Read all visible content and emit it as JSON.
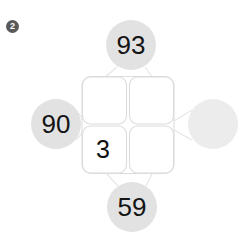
{
  "marker": {
    "label": "2",
    "name": "problem-number-badge"
  },
  "colors": {
    "bubble_fill": "#e2e2e2",
    "bubble_fill_empty": "#ececec",
    "connector_stroke": "#e6e6e6",
    "grid_stroke": "#dcdcdc",
    "cell_fill": "#ffffff",
    "text": "#101010",
    "marker_fill": "#5a5a5a",
    "marker_text": "#ffffff",
    "background": "#ffffff"
  },
  "diagram": {
    "type": "number-bond-box",
    "bubbles": {
      "top": {
        "value": "93",
        "empty": false
      },
      "left": {
        "value": "90",
        "empty": false
      },
      "right": {
        "value": "",
        "empty": true
      },
      "bottom": {
        "value": "59",
        "empty": false
      }
    },
    "grid": {
      "rows": 2,
      "cols": 2,
      "cells": [
        {
          "position": "top-left",
          "value": ""
        },
        {
          "position": "top-right",
          "value": ""
        },
        {
          "position": "bottom-left",
          "value": "3"
        },
        {
          "position": "bottom-right",
          "value": ""
        }
      ]
    }
  }
}
